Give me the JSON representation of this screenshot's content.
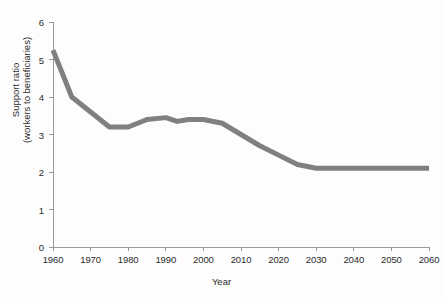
{
  "chart_data": {
    "type": "line",
    "title": "",
    "subtitle": "",
    "xlabel": "Year",
    "ylabel": "Support ratio (workers to beneficiaries)",
    "ylabel_lines": [
      "Support ratio",
      "(workers to beneficiaries)"
    ],
    "xlim": [
      1960,
      2060
    ],
    "ylim": [
      0,
      6
    ],
    "xticks": [
      1960,
      1970,
      1980,
      1990,
      2000,
      2010,
      2020,
      2030,
      2040,
      2050,
      2060
    ],
    "xtick_labels": [
      "1960",
      "1970",
      "1980",
      "1990",
      "2000",
      "2010",
      "2020",
      "2030",
      "2040",
      "2050",
      "2060"
    ],
    "yticks": [
      0,
      1,
      2,
      3,
      4,
      5,
      6
    ],
    "ytick_labels": [
      "0",
      "1",
      "2",
      "3",
      "4",
      "5",
      "6"
    ],
    "grid": false,
    "legend": false,
    "legend_position": "none",
    "line_color": "#808080",
    "line_width": 5,
    "axis_color": "#9a9a9a",
    "text_color": "#2b2b2b",
    "background_color": "#fdfdfd",
    "x": [
      1960,
      1965,
      1970,
      1975,
      1980,
      1985,
      1990,
      1993,
      1996,
      2000,
      2005,
      2010,
      2015,
      2020,
      2025,
      2030,
      2035,
      2040,
      2045,
      2050,
      2055,
      2060
    ],
    "values": [
      5.25,
      4.0,
      3.6,
      3.2,
      3.2,
      3.4,
      3.45,
      3.35,
      3.4,
      3.4,
      3.3,
      3.0,
      2.7,
      2.45,
      2.2,
      2.1,
      2.1,
      2.1,
      2.1,
      2.1,
      2.1,
      2.1
    ],
    "series": [
      {
        "name": "Support ratio",
        "x": [
          1960,
          1965,
          1970,
          1975,
          1980,
          1985,
          1990,
          1993,
          1996,
          2000,
          2005,
          2010,
          2015,
          2020,
          2025,
          2030,
          2035,
          2040,
          2045,
          2050,
          2055,
          2060
        ],
        "values": [
          5.25,
          4.0,
          3.6,
          3.2,
          3.2,
          3.4,
          3.45,
          3.35,
          3.4,
          3.4,
          3.3,
          3.0,
          2.7,
          2.45,
          2.2,
          2.1,
          2.1,
          2.1,
          2.1,
          2.1,
          2.1,
          2.1
        ]
      }
    ],
    "annotations": []
  }
}
